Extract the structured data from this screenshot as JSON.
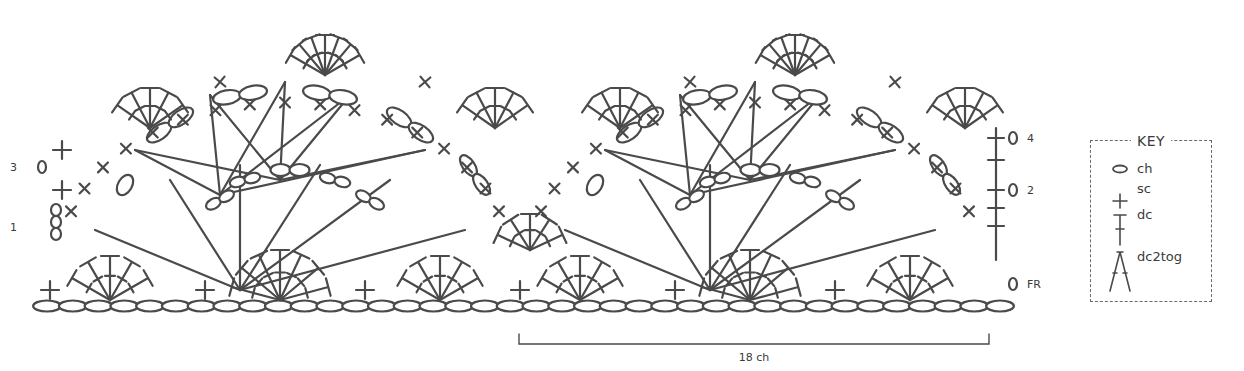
{
  "chart_title": "",
  "key": {
    "title": "KEY",
    "items": [
      {
        "symbol": "oval-icon",
        "label": "ch"
      },
      {
        "symbol": "plus-icon",
        "label": "sc"
      },
      {
        "symbol": "dc-icon",
        "label": "dc"
      },
      {
        "symbol": "dc2tog-icon",
        "label": "dc2tog"
      }
    ]
  },
  "row_labels": {
    "left": [
      {
        "label": "3",
        "y": 167
      },
      {
        "label": "1",
        "y": 227
      }
    ],
    "right": [
      {
        "label": "4",
        "y": 138
      },
      {
        "label": "2",
        "y": 190
      },
      {
        "label": "FR",
        "y": 284
      }
    ]
  },
  "repeat": {
    "label": "18 ch",
    "x_start": 519,
    "x_end": 989,
    "y": 344
  },
  "foundation": {
    "chain_count": 38,
    "x_start": 47,
    "x_end": 1000,
    "y": 306
  },
  "colors": {
    "stroke": "#4a4a4a",
    "text": "#3a3a3a",
    "background": "#ffffff"
  }
}
